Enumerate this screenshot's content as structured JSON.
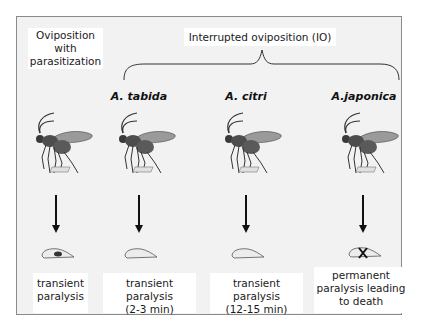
{
  "header": {
    "control_label": [
      "Oviposition",
      "with",
      "parasitization"
    ],
    "io_label": "Interrupted oviposition (IO)"
  },
  "columns": [
    {
      "species": "",
      "wasp_icon": "wasp-ovipositing-icon",
      "larva_state": "parasitized (egg present)",
      "outcome": [
        "transient",
        "paralysis"
      ]
    },
    {
      "species": "A. tabida",
      "wasp_icon": "wasp-ovipositing-icon",
      "larva_state": "unparasitized",
      "outcome": [
        "transient paralysis",
        "(2-3 min)"
      ]
    },
    {
      "species": "A. citri",
      "wasp_icon": "wasp-ovipositing-icon",
      "larva_state": "unparasitized",
      "outcome": [
        "transient paralysis",
        "(12-15 min)"
      ]
    },
    {
      "species": "A.japonica",
      "wasp_icon": "wasp-ovipositing-icon",
      "larva_state": "dead (X mark)",
      "outcome": [
        "permanent",
        "paralysis leading",
        "to death"
      ]
    }
  ],
  "colors": {
    "panel_bg": "#f2f2f2",
    "label_bg": "#ffffff",
    "ink": "#111111"
  }
}
